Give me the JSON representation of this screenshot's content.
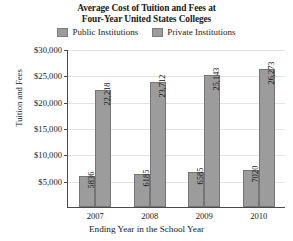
{
  "chart_data": {
    "type": "bar",
    "title": "Average Cost of Tuition and Fees at Four-Year United States Colleges",
    "title_lines": [
      "Average Cost of Tuition and Fees at",
      "Four-Year United States Colleges"
    ],
    "xlabel": "Ending Year in the School Year",
    "ylabel": "Tuition and Fees",
    "categories": [
      "2007",
      "2008",
      "2009",
      "2010"
    ],
    "series": [
      {
        "name": "Public Institutions",
        "color": "#9c9c9c",
        "values": [
          5836,
          23712,
          6585,
          7020
        ],
        "value_labels": [
          "5836",
          "6185",
          "6585",
          "7020"
        ],
        "data_values": [
          5836,
          6185,
          6585,
          7020
        ]
      },
      {
        "name": "Private Institutions",
        "color": "#9c9c9c",
        "values": [
          22218,
          23712,
          25143,
          26273
        ],
        "value_labels": [
          "22,218",
          "23,712",
          "25,143",
          "26,273"
        ],
        "data_values": [
          22218,
          23712,
          25143,
          26273
        ]
      }
    ],
    "ytick_labels": [
      "$30,000",
      "$25,000",
      "$20,000",
      "$15,000",
      "$10,000",
      "$5,000"
    ],
    "ytick_values": [
      30000,
      25000,
      20000,
      15000,
      10000,
      5000
    ],
    "ylim": [
      0,
      30000
    ],
    "grid": true,
    "legend_position": "top-center",
    "legend": [
      "Public Institutions",
      "Private Institutions"
    ]
  }
}
